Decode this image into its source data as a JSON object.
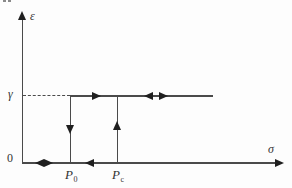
{
  "diagram": {
    "type": "hysteresis-relay-loop",
    "axes": {
      "y_label": "ε",
      "x_label": "σ",
      "origin_label": "0"
    },
    "labels": {
      "gamma": "γ",
      "p0_base": "P",
      "p0_sub": "0",
      "pc_base": "P",
      "pc_sub": "c"
    },
    "arrows": {
      "gamma_line": [
        "right",
        "left",
        "right"
      ],
      "p0_vertical_line": [
        "down"
      ],
      "pc_vertical_line": [
        "up"
      ],
      "x_axis_near_origin": [
        "left",
        "right"
      ],
      "x_axis_between_p0_pc": [
        "left"
      ],
      "y_axis_tip": "up",
      "x_axis_tip": "right"
    },
    "lines": {
      "dashed_leader": "from γ on ε-axis to upper branch start at P0",
      "upper_branch": "ε = γ from P0 rightward",
      "lower_branch": "ε = 0 along σ-axis",
      "jump_down_at": "P0",
      "jump_up_at": "Pc"
    },
    "colors": {
      "line": "#4a4a4a",
      "arrow": "#1f1f1f",
      "text": "#333333",
      "background": "#fdfdfd"
    }
  }
}
